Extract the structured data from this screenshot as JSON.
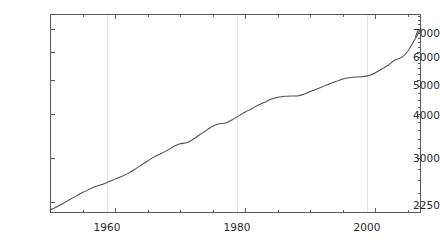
{
  "chart_data": {
    "type": "line",
    "title": "",
    "subtitle": "",
    "xlabel": "",
    "ylabel": "",
    "xlim": [
      1950,
      2007
    ],
    "ylim": [
      2100,
      7700
    ],
    "yscale": "log",
    "xscale": "linear",
    "grid": "vertical-major-only",
    "legend": "none",
    "line_color": "#4d4d4d",
    "background_color": "#ffffff",
    "frame_color": "#5a5a5a",
    "gridline_color": "#e2e2e2",
    "xticks_major": [
      1960,
      1980,
      2000
    ],
    "xtick_labels": [
      "1960",
      "1980",
      "2000"
    ],
    "xticks_minor": [
      1950,
      1955,
      1965,
      1970,
      1975,
      1985,
      1990,
      1995,
      2005
    ],
    "yticks_major": [
      2250,
      3000,
      4000,
      5000,
      6000,
      7000
    ],
    "ytick_labels": [
      "2250",
      "3000",
      "4000",
      "5000",
      "6000",
      "7000"
    ],
    "x": [
      1950,
      1951,
      1952,
      1953,
      1954,
      1955,
      1956,
      1957,
      1958,
      1959,
      1960,
      1961,
      1962,
      1963,
      1964,
      1965,
      1966,
      1967,
      1968,
      1969,
      1970,
      1971,
      1972,
      1973,
      1974,
      1975,
      1976,
      1977,
      1978,
      1979,
      1980,
      1981,
      1982,
      1983,
      1984,
      1985,
      1986,
      1987,
      1988,
      1989,
      1990,
      1991,
      1992,
      1993,
      1994,
      1995,
      1996,
      1997,
      1998,
      1999,
      2000,
      2001,
      2002,
      2003,
      2004,
      2005,
      2006,
      2007
    ],
    "values": [
      2140,
      2185,
      2235,
      2290,
      2345,
      2400,
      2450,
      2495,
      2530,
      2575,
      2620,
      2665,
      2720,
      2790,
      2870,
      2950,
      3030,
      3090,
      3160,
      3240,
      3300,
      3320,
      3400,
      3500,
      3600,
      3700,
      3760,
      3780,
      3860,
      3960,
      4060,
      4150,
      4250,
      4330,
      4420,
      4470,
      4500,
      4510,
      4510,
      4560,
      4640,
      4720,
      4800,
      4880,
      4960,
      5040,
      5080,
      5100,
      5110,
      5150,
      5250,
      5380,
      5520,
      5700,
      5790,
      6050,
      6500,
      7000
    ],
    "series_name": "series-1",
    "n_points": 58
  },
  "figure": {
    "width": 440,
    "height": 244
  }
}
